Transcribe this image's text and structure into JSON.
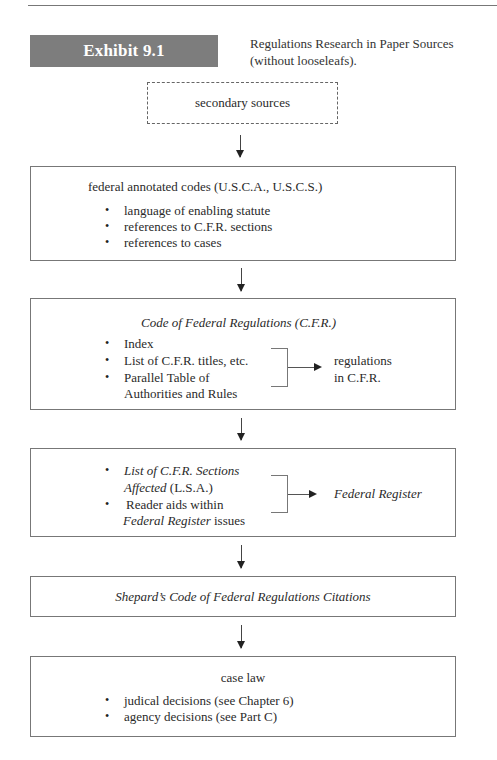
{
  "header": {
    "exhibit_label": "Exhibit 9.1",
    "caption_line1": "Regulations Research in Paper Sources",
    "caption_line2": "(without looseleafs)."
  },
  "colors": {
    "badge": "#7d7d7d",
    "border": "#777777",
    "text": "#2a2a2a"
  },
  "flow": {
    "secondary": {
      "label": "secondary sources",
      "style": "dashed"
    },
    "annotated_codes": {
      "heading": "federal annotated codes (U.S.C.A., U.S.C.S.)",
      "items": [
        "language of enabling statute",
        "references to C.F.R. sections",
        "references to cases"
      ]
    },
    "cfr": {
      "heading": "Code of Federal Regulations (C.F.R.)",
      "items": [
        "Index",
        "List of C.F.R. titles, etc.",
        "Parallel Table of",
        "Authorities and Rules"
      ],
      "result_line1": "regulations",
      "result_line2": "in C.F.R."
    },
    "lsa": {
      "item1_italic": "List of C.F.R. Sections",
      "item1_line2_italic": "Affected",
      "item1_line2_rest": " (L.S.A.)",
      "item2_line1": "Reader aids within",
      "item2_line2_italic": "Federal Register",
      "item2_line2_rest": " issues",
      "result": "Federal Register"
    },
    "shepards": {
      "label": "Shepard’s Code of Federal Regulations Citations"
    },
    "case_law": {
      "heading": "case law",
      "items": [
        "judical decisions (see Chapter 6)",
        "agency decisions (see Part C)"
      ]
    }
  },
  "bullet_glyph": "•"
}
